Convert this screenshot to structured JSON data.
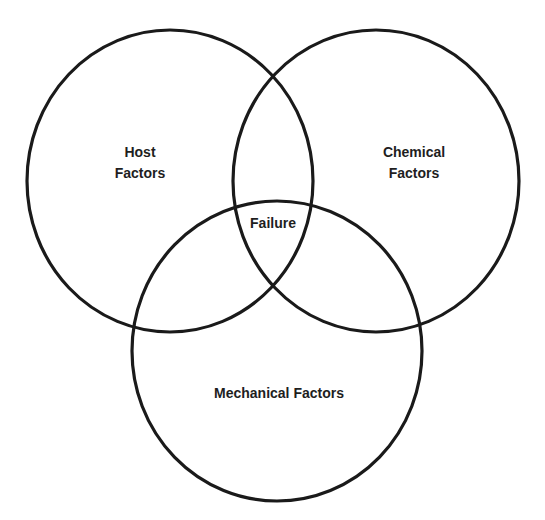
{
  "diagram": {
    "type": "venn",
    "colors": {
      "background": "#ffffff",
      "stroke": "#1a1a1a",
      "text": "#1e1e1e"
    },
    "sets": [
      {
        "id": "host",
        "label_line1": "Host",
        "label_line2": "Factors"
      },
      {
        "id": "chemical",
        "label_line1": "Chemical",
        "label_line2": "Factors"
      },
      {
        "id": "mechanical",
        "label": "Mechanical Factors"
      }
    ],
    "intersection": {
      "label": "Failure"
    }
  }
}
